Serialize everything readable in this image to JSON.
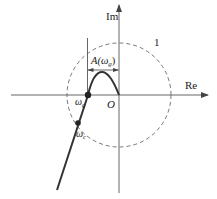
{
  "diagram": {
    "type": "nyquist-plot",
    "axes": {
      "imaginary_label": "Im",
      "real_label": "Re",
      "origin_label": "O"
    },
    "unit_circle": {
      "radius_label": "1",
      "style": "dashed"
    },
    "annotations": {
      "gain_margin_label_prefix": "A(",
      "gain_margin_symbol": "ω",
      "gain_margin_subscript": "g",
      "gain_margin_label_suffix": ")"
    },
    "points": [
      {
        "name": "omega-g",
        "symbol": "ω",
        "subscript": "g",
        "description": "crossing of negative real axis"
      },
      {
        "name": "omega-c",
        "symbol": "ω",
        "subscript": "c",
        "description": "crossing of unit circle"
      }
    ],
    "colors": {
      "axis": "#555555",
      "curve": "#333333",
      "circle": "#666666",
      "text": "#222222"
    }
  }
}
